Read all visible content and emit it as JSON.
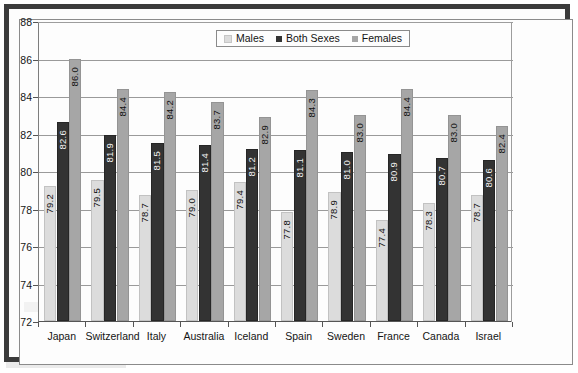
{
  "chart_data": {
    "type": "bar",
    "title": "",
    "xlabel": "",
    "ylabel": "",
    "ylim": [
      72,
      88
    ],
    "ytick_step": 2,
    "yticks": [
      88,
      86,
      84,
      82,
      80,
      78,
      76,
      74,
      72
    ],
    "grid": true,
    "legend_position": "top-center",
    "categories": [
      "Japan",
      "Switzerland",
      "Italy",
      "Australia",
      "Iceland",
      "Spain",
      "Sweden",
      "France",
      "Canada",
      "Israel"
    ],
    "series": [
      {
        "name": "Males",
        "color": "#dcdcdc",
        "values": [
          79.2,
          79.5,
          78.7,
          79.0,
          79.4,
          77.8,
          78.9,
          77.4,
          78.3,
          78.7
        ]
      },
      {
        "name": "Both Sexes",
        "color": "#333333",
        "values": [
          82.6,
          81.9,
          81.5,
          81.4,
          81.2,
          81.1,
          81.0,
          80.9,
          80.7,
          80.6
        ]
      },
      {
        "name": "Females",
        "color": "#a6a6a6",
        "values": [
          86.0,
          84.4,
          84.2,
          83.7,
          82.9,
          84.3,
          83.0,
          84.4,
          83.0,
          82.4
        ]
      }
    ]
  },
  "legend": {
    "items": [
      {
        "label": "Males",
        "swatch": "males"
      },
      {
        "label": "Both Sexes",
        "swatch": "both"
      },
      {
        "label": "Females",
        "swatch": "females"
      }
    ]
  }
}
